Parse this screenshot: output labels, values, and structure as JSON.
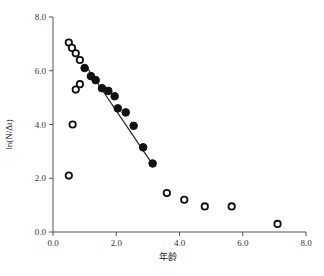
{
  "chart_data": {
    "type": "scatter",
    "title": "",
    "xlabel": "年龄",
    "ylabel": "ln(N/Δt)",
    "xlim": [
      0,
      8
    ],
    "ylim": [
      0,
      8
    ],
    "x_ticks": [
      "0.0",
      "2.0",
      "4.0",
      "6.0",
      "8.0"
    ],
    "y_ticks": [
      "0.0",
      "2.0",
      "4.0",
      "6.0",
      "8.0"
    ],
    "grid": false,
    "legend": null,
    "series": [
      {
        "name": "open",
        "marker": "open-circle",
        "points": [
          [
            0.5,
            7.05
          ],
          [
            0.6,
            6.85
          ],
          [
            0.72,
            6.65
          ],
          [
            0.85,
            6.4
          ],
          [
            0.85,
            5.5
          ],
          [
            0.72,
            5.3
          ],
          [
            0.62,
            4.0
          ],
          [
            0.5,
            2.1
          ],
          [
            3.6,
            1.45
          ],
          [
            4.15,
            1.2
          ],
          [
            4.8,
            0.95
          ],
          [
            5.65,
            0.95
          ],
          [
            7.1,
            0.3
          ]
        ]
      },
      {
        "name": "filled",
        "marker": "filled-circle",
        "points": [
          [
            1.0,
            6.1
          ],
          [
            1.2,
            5.8
          ],
          [
            1.35,
            5.65
          ],
          [
            1.55,
            5.35
          ],
          [
            1.75,
            5.25
          ],
          [
            1.95,
            5.05
          ],
          [
            2.05,
            4.6
          ],
          [
            2.3,
            4.45
          ],
          [
            2.55,
            3.95
          ],
          [
            2.85,
            3.15
          ],
          [
            3.15,
            2.55
          ]
        ]
      }
    ],
    "fit_line": {
      "from": [
        1.0,
        6.25
      ],
      "to": [
        3.1,
        2.6
      ]
    }
  },
  "colors": {
    "axis": "#555555",
    "marker": "#111111",
    "background": "#ffffff"
  }
}
